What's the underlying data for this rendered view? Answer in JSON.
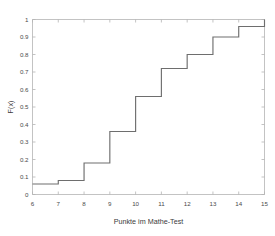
{
  "chart_data": {
    "type": "line",
    "subtype": "step-ecdf",
    "title": "",
    "xlabel": "Punkte im Mathe-Test",
    "ylabel": "F(x)",
    "x": [
      6,
      7,
      8,
      9,
      10,
      11,
      12,
      13,
      14,
      15
    ],
    "values": [
      0.06,
      0.08,
      0.18,
      0.36,
      0.56,
      0.72,
      0.8,
      0.9,
      0.96,
      1
    ],
    "series": [
      {
        "name": "F(x)",
        "values": [
          0.06,
          0.08,
          0.18,
          0.36,
          0.56,
          0.72,
          0.8,
          0.9,
          0.96,
          1
        ]
      }
    ],
    "xlim": [
      6,
      15
    ],
    "ylim": [
      0,
      1
    ],
    "xticks": [
      6,
      7,
      8,
      9,
      10,
      11,
      12,
      13,
      14,
      15
    ],
    "xtick_labels": [
      "6",
      "7",
      "8",
      "9",
      "10",
      "11",
      "12",
      "13",
      "14",
      "15"
    ],
    "yticks": [
      0,
      0.1,
      0.2,
      0.3,
      0.4,
      0.5,
      0.6,
      0.7,
      0.8,
      0.9,
      1
    ],
    "ytick_labels": [
      "0",
      "0.1",
      "0.2",
      "0.3",
      "0.4",
      "0.5",
      "0.6",
      "0.7",
      "0.8",
      "0.9",
      "1"
    ],
    "grid": false,
    "legend": false,
    "colors": {
      "line": "#6e6e6e",
      "axis": "#b4b4b4",
      "text": "#3a3a3a",
      "background": "#ffffff"
    }
  }
}
